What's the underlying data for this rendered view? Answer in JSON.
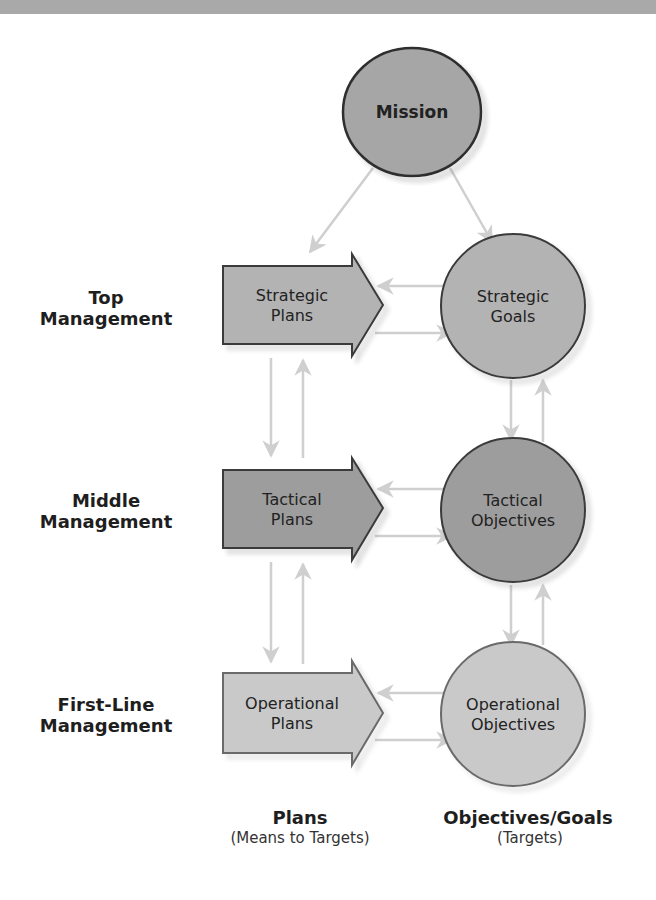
{
  "mission": {
    "label": "Mission"
  },
  "levels": [
    {
      "label_line1": "Top",
      "label_line2": "Management",
      "plan": {
        "line1": "Strategic",
        "line2": "Plans"
      },
      "goal": {
        "line1": "Strategic",
        "line2": "Goals"
      }
    },
    {
      "label_line1": "Middle",
      "label_line2": "Management",
      "plan": {
        "line1": "Tactical",
        "line2": "Plans"
      },
      "goal": {
        "line1": "Tactical",
        "line2": "Objectives"
      }
    },
    {
      "label_line1": "First-Line",
      "label_line2": "Management",
      "plan": {
        "line1": "Operational",
        "line2": "Plans"
      },
      "goal": {
        "line1": "Operational",
        "line2": "Objectives"
      }
    }
  ],
  "columns": {
    "plans": {
      "title": "Plans",
      "subtitle": "(Means to Targets)"
    },
    "objectives": {
      "title": "Objectives/Goals",
      "subtitle": "(Targets)"
    }
  },
  "colors": {
    "banner": "#a9a9a9",
    "mission_fill": "#a6a6a6",
    "strategic_fill": "#b3b3b3",
    "tactical_fill": "#9d9d9d",
    "operational_fill": "#c9c9c9",
    "connector": "#cfcfcf",
    "outline": "#3a3a3a"
  }
}
